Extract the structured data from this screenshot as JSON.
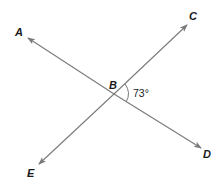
{
  "diagram": {
    "type": "intersecting-lines",
    "intersection_point": "B",
    "lines": [
      {
        "name": "line-AD",
        "from": "A",
        "to": "D"
      },
      {
        "name": "line-EC",
        "from": "E",
        "to": "C"
      }
    ],
    "points": {
      "A": {
        "label": "A"
      },
      "B": {
        "label": "B"
      },
      "C": {
        "label": "C"
      },
      "D": {
        "label": "D"
      },
      "E": {
        "label": "E"
      }
    },
    "angle": {
      "between": [
        "C",
        "B",
        "D"
      ],
      "label": "73°",
      "value_degrees": 73
    },
    "colors": {
      "line": "#7a7a7a",
      "text": "#1a1a1a",
      "background": "#ffffff"
    }
  }
}
